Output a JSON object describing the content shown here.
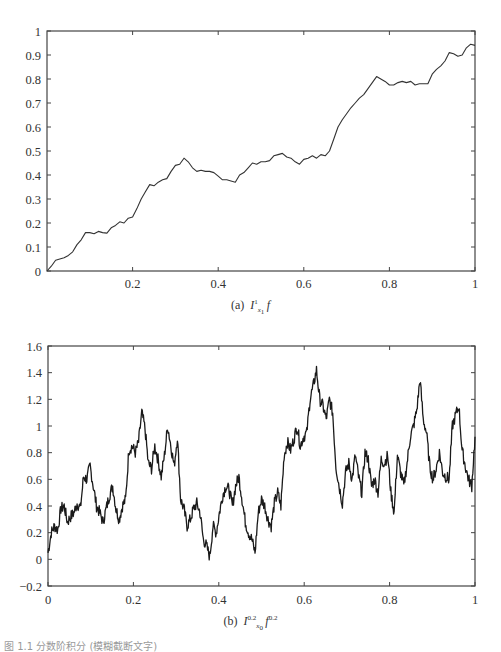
{
  "chart_data": [
    {
      "id": "a",
      "type": "line",
      "title": "",
      "caption_prefix": "(a)",
      "caption_math": "I^1_{x_1} f",
      "xlabel": "",
      "ylabel": "",
      "xlim": [
        0,
        1
      ],
      "ylim": [
        0,
        1
      ],
      "xticks": [
        0.2,
        0.4,
        0.6,
        0.8,
        1
      ],
      "xtick_labels": [
        "0.2",
        "0.4",
        "0.6",
        "0.8",
        "1"
      ],
      "yticks": [
        0,
        0.1,
        0.2,
        0.3,
        0.4,
        0.5,
        0.6,
        0.7,
        0.8,
        0.9,
        1
      ],
      "ytick_labels": [
        "0",
        "0.1",
        "0.2",
        "0.3",
        "0.4",
        "0.5",
        "0.6",
        "0.7",
        "0.8",
        "0.9",
        "1"
      ],
      "grid": false,
      "legend": null,
      "series": [
        {
          "name": "I^1_{x1} f",
          "color": "#333333",
          "x": [
            0,
            0.01,
            0.02,
            0.03,
            0.04,
            0.05,
            0.06,
            0.07,
            0.08,
            0.09,
            0.1,
            0.11,
            0.12,
            0.13,
            0.14,
            0.15,
            0.16,
            0.17,
            0.18,
            0.19,
            0.2,
            0.21,
            0.22,
            0.23,
            0.24,
            0.25,
            0.26,
            0.27,
            0.28,
            0.29,
            0.3,
            0.31,
            0.32,
            0.33,
            0.34,
            0.35,
            0.36,
            0.37,
            0.38,
            0.39,
            0.4,
            0.41,
            0.42,
            0.43,
            0.44,
            0.45,
            0.46,
            0.47,
            0.48,
            0.49,
            0.5,
            0.51,
            0.52,
            0.53,
            0.54,
            0.55,
            0.56,
            0.57,
            0.58,
            0.59,
            0.6,
            0.61,
            0.62,
            0.63,
            0.64,
            0.65,
            0.66,
            0.67,
            0.68,
            0.69,
            0.7,
            0.71,
            0.72,
            0.73,
            0.74,
            0.75,
            0.76,
            0.77,
            0.78,
            0.79,
            0.8,
            0.81,
            0.82,
            0.83,
            0.84,
            0.85,
            0.86,
            0.87,
            0.88,
            0.89,
            0.9,
            0.91,
            0.92,
            0.93,
            0.94,
            0.95,
            0.96,
            0.97,
            0.98,
            0.99,
            1.0
          ],
          "y": [
            0,
            0.02,
            0.045,
            0.05,
            0.055,
            0.065,
            0.08,
            0.11,
            0.13,
            0.16,
            0.16,
            0.155,
            0.165,
            0.16,
            0.158,
            0.18,
            0.19,
            0.205,
            0.2,
            0.22,
            0.225,
            0.26,
            0.3,
            0.33,
            0.36,
            0.355,
            0.37,
            0.38,
            0.385,
            0.415,
            0.44,
            0.445,
            0.47,
            0.455,
            0.43,
            0.415,
            0.42,
            0.415,
            0.415,
            0.41,
            0.395,
            0.38,
            0.38,
            0.375,
            0.37,
            0.4,
            0.41,
            0.43,
            0.45,
            0.445,
            0.455,
            0.455,
            0.46,
            0.48,
            0.485,
            0.49,
            0.475,
            0.47,
            0.455,
            0.445,
            0.465,
            0.47,
            0.48,
            0.47,
            0.485,
            0.48,
            0.5,
            0.55,
            0.6,
            0.63,
            0.655,
            0.68,
            0.7,
            0.72,
            0.735,
            0.76,
            0.785,
            0.81,
            0.8,
            0.79,
            0.775,
            0.775,
            0.785,
            0.79,
            0.785,
            0.79,
            0.775,
            0.78,
            0.78,
            0.78,
            0.82,
            0.84,
            0.855,
            0.875,
            0.91,
            0.905,
            0.895,
            0.9,
            0.93,
            0.945,
            0.94
          ]
        }
      ]
    },
    {
      "id": "b",
      "type": "line",
      "title": "",
      "caption_prefix": "(b)",
      "caption_math": "I^{0.2}_{x_0} f^{0.2}",
      "xlabel": "",
      "ylabel": "",
      "xlim": [
        0,
        1
      ],
      "ylim": [
        -0.2,
        1.6
      ],
      "xticks": [
        0,
        0.2,
        0.4,
        0.6,
        0.8,
        1
      ],
      "xtick_labels": [
        "0",
        "0.2",
        "0.4",
        "0.6",
        "0.8",
        "1"
      ],
      "yticks": [
        -0.2,
        0,
        0.2,
        0.4,
        0.6,
        0.8,
        1,
        1.2,
        1.4,
        1.6
      ],
      "ytick_labels": [
        "−0.2",
        "0",
        "0.2",
        "0.4",
        "0.6",
        "0.8",
        "1",
        "1.2",
        "1.4",
        "1.6"
      ],
      "grid": false,
      "legend": null,
      "series": [
        {
          "name": "I^{0.2}_{x0} f^{0.2}",
          "color": "#1a1a1a",
          "x": [
            0,
            0.01,
            0.02,
            0.03,
            0.04,
            0.05,
            0.06,
            0.07,
            0.08,
            0.09,
            0.1,
            0.11,
            0.12,
            0.13,
            0.14,
            0.15,
            0.16,
            0.17,
            0.18,
            0.19,
            0.2,
            0.21,
            0.22,
            0.23,
            0.24,
            0.25,
            0.26,
            0.27,
            0.28,
            0.29,
            0.3,
            0.31,
            0.32,
            0.33,
            0.34,
            0.35,
            0.36,
            0.37,
            0.38,
            0.39,
            0.4,
            0.41,
            0.42,
            0.43,
            0.44,
            0.45,
            0.46,
            0.47,
            0.48,
            0.49,
            0.5,
            0.51,
            0.52,
            0.53,
            0.54,
            0.55,
            0.56,
            0.57,
            0.58,
            0.59,
            0.6,
            0.61,
            0.62,
            0.63,
            0.64,
            0.65,
            0.66,
            0.67,
            0.68,
            0.69,
            0.7,
            0.71,
            0.72,
            0.73,
            0.74,
            0.75,
            0.76,
            0.77,
            0.78,
            0.79,
            0.8,
            0.81,
            0.82,
            0.83,
            0.84,
            0.85,
            0.86,
            0.87,
            0.88,
            0.89,
            0.9,
            0.91,
            0.92,
            0.93,
            0.94,
            0.95,
            0.96,
            0.97,
            0.98,
            0.99,
            1.0
          ],
          "y": [
            0.05,
            0.2,
            0.25,
            0.22,
            0.38,
            0.4,
            0.28,
            0.32,
            0.35,
            0.42,
            0.38,
            0.62,
            0.6,
            0.7,
            0.55,
            0.4,
            0.35,
            0.28,
            0.38,
            0.48,
            0.55,
            0.38,
            0.3,
            0.4,
            0.45,
            0.82,
            0.85,
            0.8,
            0.88,
            1.1,
            0.98,
            0.72,
            0.68,
            0.85,
            0.75,
            0.62,
            0.78,
            1.0,
            0.85,
            0.7,
            0.92,
            0.45,
            0.38,
            0.25,
            0.3,
            0.38,
            0.42,
            0.35,
            0.15,
            0.1,
            0.02,
            0.25,
            0.2,
            0.35,
            0.48,
            0.55,
            0.52,
            0.4,
            0.55,
            0.62,
            0.45,
            0.28,
            0.2,
            0.15,
            0.05,
            0.35,
            0.45,
            0.4,
            0.3,
            0.25,
            0.42,
            0.5,
            0.4,
            0.78,
            0.88,
            0.82,
            0.9,
            1.0,
            0.85,
            0.92,
            0.95,
            1.2,
            1.3,
            1.42,
            1.2,
            1.15,
            1.05,
            1.2,
            1.1,
            0.7,
            0.55,
            0.42,
            0.65,
            0.72,
            0.6,
            0.78,
            0.62,
            0.5,
            0.8,
            0.75,
            0.55,
            0.6,
            0.5,
            0.75,
            0.72,
            0.78,
            0.5,
            0.35,
            0.78,
            0.65,
            0.55,
            0.72,
            0.92,
            1.0,
            1.12,
            1.35,
            1.05,
            0.95,
            0.7,
            0.6,
            0.68,
            0.8,
            0.65,
            0.62,
            0.6,
            1.0,
            1.08,
            1.15,
            0.82,
            0.7,
            0.6,
            0.55,
            0.92
          ]
        }
      ]
    }
  ],
  "captions": {
    "a_prefix": "(a)",
    "b_prefix": "(b)",
    "figure_caption": "图 1.1 分数阶积分 (模糊截断文字)"
  }
}
